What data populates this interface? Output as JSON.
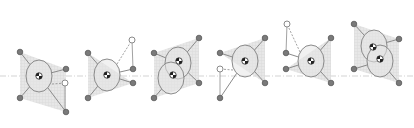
{
  "diagram": {
    "title": "",
    "colors": {
      "background": "#ffffff",
      "stroke": "#8a8a8a",
      "ellipse_fill": "#e6e6e6",
      "support_polygon": "#d9d9d9",
      "foot_fill": "#7a7a7a",
      "swing_foot_fill": "#ffffff",
      "centerline": "#c8c8c8",
      "com_dark": "#222222"
    },
    "centerline_y": 76,
    "stages": [
      {
        "id": 1,
        "bodies": [
          {
            "cx": 39,
            "cy": 76,
            "rx": 13,
            "ry": 16
          }
        ],
        "hip": [
          [
            36,
            62
          ],
          [
            47,
            70
          ],
          [
            32,
            88
          ],
          [
            46,
            88
          ]
        ],
        "feet": [
          [
            20,
            52
          ],
          [
            66,
            69
          ],
          [
            20,
            98
          ],
          [
            66,
            112
          ]
        ],
        "support": [
          [
            20,
            52
          ],
          [
            66,
            69
          ],
          [
            66,
            112
          ],
          [
            20,
            98
          ]
        ],
        "swing": {
          "from": [
            52,
            84
          ],
          "to": [
            65,
            83
          ],
          "drop": [
            65,
            112
          ]
        }
      },
      {
        "id": 2,
        "bodies": [
          {
            "cx": 107,
            "cy": 75,
            "rx": 13,
            "ry": 16
          }
        ],
        "hip": [
          [
            101,
            61
          ],
          [
            117,
            68
          ],
          [
            100,
            89
          ],
          [
            117,
            82
          ]
        ],
        "feet": [
          [
            88,
            53
          ],
          [
            133,
            69
          ],
          [
            88,
            98
          ],
          [
            133,
            83
          ]
        ],
        "support": [
          [
            88,
            53
          ],
          [
            133,
            83
          ],
          [
            88,
            98
          ]
        ],
        "swing": {
          "from": [
            117,
            64
          ],
          "to": [
            132,
            40
          ],
          "drop": [
            133,
            69
          ]
        }
      },
      {
        "id": 3,
        "bodies": [
          {
            "cx": 178,
            "cy": 63,
            "rx": 13,
            "ry": 16
          },
          {
            "cx": 171,
            "cy": 78,
            "rx": 13,
            "ry": 16
          }
        ],
        "com": [
          [
            179,
            61
          ],
          [
            173,
            75
          ]
        ],
        "feet": [
          [
            154,
            53
          ],
          [
            199,
            38
          ],
          [
            154,
            98
          ],
          [
            199,
            83
          ]
        ],
        "support": [
          [
            154,
            53
          ],
          [
            199,
            38
          ],
          [
            199,
            83
          ],
          [
            154,
            98
          ]
        ]
      },
      {
        "id": 4,
        "bodies": [
          {
            "cx": 245,
            "cy": 61,
            "rx": 13,
            "ry": 16
          }
        ],
        "feet": [
          [
            220,
            53
          ],
          [
            265,
            38
          ],
          [
            265,
            83
          ],
          [
            220,
            98
          ]
        ],
        "support": [
          [
            220,
            53
          ],
          [
            265,
            38
          ],
          [
            265,
            83
          ]
        ],
        "swing": {
          "from": [
            233,
            70
          ],
          "to": [
            220,
            69
          ],
          "drop": [
            220,
            98
          ]
        }
      },
      {
        "id": 5,
        "bodies": [
          {
            "cx": 311,
            "cy": 61,
            "rx": 13,
            "ry": 16
          }
        ],
        "feet": [
          [
            286,
            53
          ],
          [
            331,
            38
          ],
          [
            286,
            69
          ],
          [
            331,
            83
          ]
        ],
        "support": [
          [
            286,
            69
          ],
          [
            331,
            38
          ],
          [
            331,
            83
          ]
        ],
        "swing": {
          "from": [
            300,
            52
          ],
          "to": [
            287,
            24
          ],
          "drop": [
            286,
            53
          ]
        }
      },
      {
        "id": 6,
        "bodies": [
          {
            "cx": 374,
            "cy": 46,
            "rx": 13,
            "ry": 16
          },
          {
            "cx": 380,
            "cy": 61,
            "rx": 13,
            "ry": 16
          }
        ],
        "com": [
          [
            373,
            47
          ],
          [
            380,
            59
          ]
        ],
        "feet": [
          [
            354,
            24
          ],
          [
            399,
            39
          ],
          [
            354,
            69
          ],
          [
            399,
            83
          ]
        ],
        "support": [
          [
            354,
            24
          ],
          [
            399,
            39
          ],
          [
            399,
            83
          ],
          [
            354,
            69
          ]
        ]
      }
    ]
  }
}
